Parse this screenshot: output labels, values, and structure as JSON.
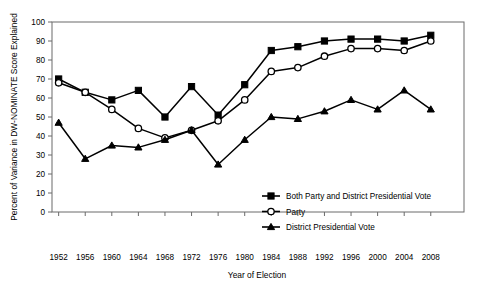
{
  "chart_data": {
    "type": "line",
    "title": "",
    "xlabel": "Year of Election",
    "ylabel": "Percent of Variance in DW-NOMINATE Score Explained",
    "xlim": [
      1950,
      2010
    ],
    "ylim": [
      0,
      100
    ],
    "grid": false,
    "legend_position": "inside-bottom-right",
    "x": [
      1952,
      1956,
      1960,
      1964,
      1968,
      1972,
      1976,
      1980,
      1984,
      1988,
      1992,
      1996,
      2000,
      2004,
      2008
    ],
    "xticklabels": [
      "1952",
      "1956",
      "1960",
      "1964",
      "1968",
      "1972",
      "1976",
      "1980",
      "1984",
      "1988",
      "1992",
      "1996",
      "2000",
      "2004",
      "2008"
    ],
    "yticklabels": [
      "0",
      "10",
      "20",
      "30",
      "40",
      "50",
      "60",
      "70",
      "80",
      "90",
      "100"
    ],
    "yticks": [
      0,
      10,
      20,
      30,
      40,
      50,
      60,
      70,
      80,
      90,
      100
    ],
    "series": [
      {
        "name": "Both Party and District Presidential Vote",
        "marker": "filled-square",
        "values": [
          70,
          63,
          59,
          64,
          50,
          66,
          51,
          67,
          85,
          87,
          90,
          91,
          91,
          90,
          93
        ]
      },
      {
        "name": "Party",
        "marker": "open-circle",
        "values": [
          68,
          63,
          54,
          44,
          39,
          43,
          48,
          59,
          74,
          76,
          82,
          86,
          86,
          85,
          90
        ]
      },
      {
        "name": "District Presidential Vote",
        "marker": "filled-triangle",
        "values": [
          47,
          28,
          35,
          34,
          38,
          43,
          25,
          38,
          50,
          49,
          53,
          59,
          54,
          64,
          54
        ]
      }
    ]
  },
  "legend": {
    "items": [
      {
        "label": "Both Party and District Presidential Vote",
        "marker": "filled-square"
      },
      {
        "label": "Party",
        "marker": "open-circle"
      },
      {
        "label": "District Presidential Vote",
        "marker": "filled-triangle"
      }
    ]
  },
  "colors": {
    "line": "#000000",
    "axis": "#6b6b6b",
    "background": "#ffffff",
    "marker_fill": "#000000",
    "marker_open": "#ffffff"
  }
}
